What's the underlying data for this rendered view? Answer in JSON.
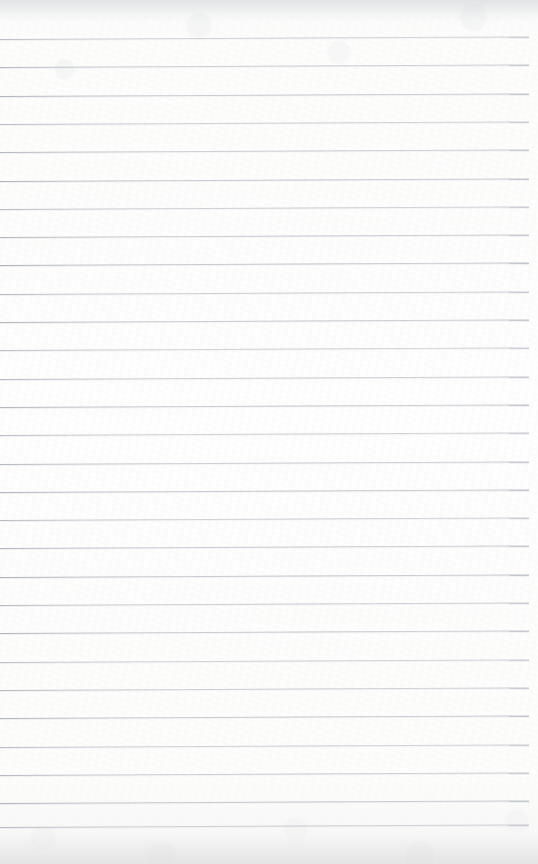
{
  "document": {
    "kind": "ruled-paper-scan",
    "title": "Blank ruled notebook page",
    "text_content": "",
    "page_width": 538,
    "page_height": 864,
    "background_color": "#fdfdfc",
    "edge_shadow_color": "#d6d7d6"
  },
  "ruling": {
    "line_color": "#b0b5bd",
    "line_thickness": 1,
    "line_count": 29,
    "first_line_y": 39,
    "line_spacing": 28.3,
    "last_line_y": 827,
    "line_start_x": 0,
    "line_end_x": 529,
    "skew_degrees": -0.27,
    "vertical_margin_rule": false,
    "line_positions": [
      39,
      67.3,
      95.6,
      123.9,
      152.2,
      180.5,
      208.8,
      237.1,
      265.4,
      293.7,
      322,
      350.3,
      378.6,
      406.9,
      435.2,
      463.5,
      491.8,
      520.1,
      548.4,
      576.7,
      605,
      633.3,
      661.6,
      689.9,
      718.2,
      746.5,
      774.8,
      803.1,
      827
    ],
    "line_widths": [
      529,
      529,
      529,
      529,
      529,
      529,
      529,
      529,
      529,
      529,
      529,
      529,
      529,
      529,
      529,
      529,
      529,
      529,
      529,
      529,
      529,
      529,
      529,
      529,
      529,
      529,
      529,
      529,
      529
    ]
  }
}
